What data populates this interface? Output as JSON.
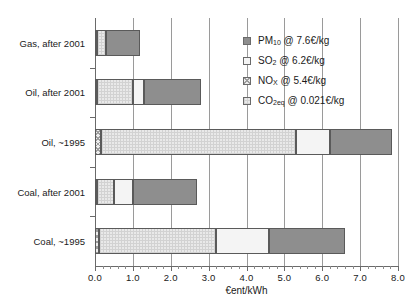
{
  "chart_data": {
    "type": "bar",
    "orientation": "horizontal",
    "stacked": true,
    "title": "",
    "xlabel": "€ent/kWh",
    "ylabel": "",
    "xlim": [
      0.0,
      8.0
    ],
    "xticks": [
      "0.0",
      "1.0",
      "2.0",
      "3.0",
      "4.0",
      "5.0",
      "6.0",
      "7.0",
      "8.0"
    ],
    "xtick_values": [
      0,
      1,
      2,
      3,
      4,
      5,
      6,
      7,
      8
    ],
    "grid": "vertical gridlines at each major x tick",
    "minor_ticks_per_interval": 5,
    "legend_position": "upper right, inside plot area",
    "categories": [
      "Gas, after 2001",
      "Oil, after 2001",
      "Oil, ~1995",
      "Coal, after 2001",
      "Coal, ~1995"
    ],
    "series": [
      {
        "name": "NOx",
        "key": "nox",
        "values": [
          0.06,
          0.06,
          0.15,
          0.06,
          0.1
        ]
      },
      {
        "name": "CO2eq",
        "key": "co2",
        "values": [
          0.24,
          0.94,
          5.15,
          0.44,
          3.1
        ]
      },
      {
        "name": "SO2",
        "key": "so2",
        "values": [
          0.0,
          0.3,
          0.9,
          0.5,
          1.4
        ]
      },
      {
        "name": "PM10",
        "key": "pm10",
        "values": [
          0.9,
          1.5,
          1.65,
          1.7,
          2.0
        ]
      }
    ],
    "stack_order": [
      "nox",
      "co2",
      "so2",
      "pm10"
    ],
    "totals": [
      1.2,
      2.8,
      7.85,
      2.7,
      6.6
    ]
  },
  "legend": {
    "items": [
      {
        "label": "PM",
        "sub": "10",
        "rest": " @ 7.6€/kg",
        "swatch": "pm10",
        "name": "legend-swatch-pm10"
      },
      {
        "label": "SO",
        "sub": "2",
        "rest": " @ 6.2€/kg",
        "swatch": "so2",
        "name": "legend-swatch-so2"
      },
      {
        "label": "NO",
        "sub": "X",
        "rest": " @ 5.4€/kg",
        "swatch": "nox",
        "name": "legend-swatch-nox"
      },
      {
        "label": "CO",
        "sub": "2eq",
        "rest": " @ 0.021€/kg",
        "swatch": "co2",
        "name": "legend-swatch-co2"
      }
    ]
  },
  "colors": {
    "pm10": "#8e8e8e",
    "so2": "#f4f4f4",
    "nox": "#ededed",
    "co2": "#e9e9e9",
    "axis": "#6a6a6a",
    "grid": "#9a9a9a",
    "text": "#1a1a1a",
    "background": "#ffffff"
  }
}
